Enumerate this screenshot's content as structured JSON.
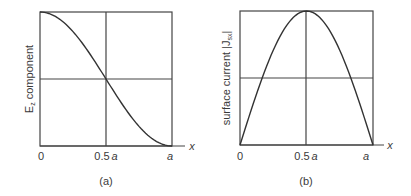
{
  "chart_data": [
    {
      "type": "line",
      "panel_label": "(a)",
      "ylabel_main": "E",
      "ylabel_sub": "z",
      "ylabel_rest": " component",
      "xlabel": "x",
      "x_ticks": [
        "0",
        "0.5 a",
        "a"
      ],
      "x_tick_parts": [
        {
          "num": "0",
          "var": ""
        },
        {
          "num": "0.5",
          "var": "a"
        },
        {
          "num": "",
          "var": "a"
        }
      ],
      "x": [
        0,
        0.1,
        0.2,
        0.3,
        0.4,
        0.5,
        0.6,
        0.7,
        0.8,
        0.9,
        1.0
      ],
      "values": [
        1.0,
        0.976,
        0.905,
        0.794,
        0.655,
        0.5,
        0.345,
        0.206,
        0.095,
        0.024,
        0.0
      ],
      "description": "cos^2-like decreasing curve from max at x=0 to zero at x=a, passing midline at 0.5a",
      "grid": {
        "vertical_at": 0.5,
        "horizontal_at": 0.5
      },
      "xlim": [
        0,
        1
      ],
      "ylim": [
        0,
        1
      ]
    },
    {
      "type": "line",
      "panel_label": "(b)",
      "ylabel_main": "surface current |J",
      "ylabel_sub": "sx",
      "ylabel_rest": "|",
      "xlabel": "x",
      "x_ticks": [
        "0",
        "0.5 a",
        "a"
      ],
      "x_tick_parts": [
        {
          "num": "0",
          "var": ""
        },
        {
          "num": "0.5",
          "var": "a"
        },
        {
          "num": "",
          "var": "a"
        }
      ],
      "x": [
        0,
        0.1,
        0.2,
        0.3,
        0.4,
        0.5,
        0.6,
        0.7,
        0.8,
        0.9,
        1.0
      ],
      "values": [
        0.0,
        0.309,
        0.588,
        0.809,
        0.951,
        1.0,
        0.951,
        0.809,
        0.588,
        0.309,
        0.0
      ],
      "description": "sine half-wave from zero at x=0 to max at 0.5a back to zero at x=a",
      "grid": {
        "vertical_at": 0.5,
        "horizontal_at": 0.5
      },
      "xlim": [
        0,
        1
      ],
      "ylim": [
        0,
        1
      ]
    }
  ]
}
